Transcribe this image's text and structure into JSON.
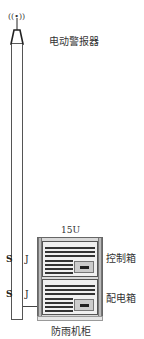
{
  "diagram": {
    "alarm_label": "电动警报器",
    "rack_units_label": "15U",
    "control_box_label": "控制箱",
    "power_box_label": "配电箱",
    "cabinet_label": "防雨机柜",
    "antenna_icon": "((•))",
    "hook_symbol": "S",
    "clamp_symbol": "J"
  }
}
